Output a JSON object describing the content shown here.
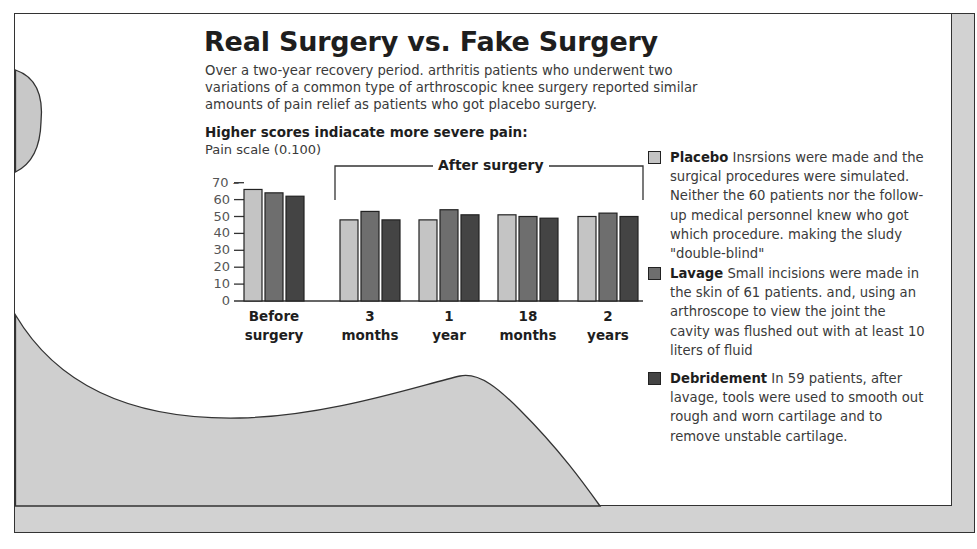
{
  "title": "Real Surgery vs. Fake Surgery",
  "subtitle": "Over a two-year recovery period. arthritis patients who underwent two variations of a common type of arthroscopic knee surgery reported similar amounts of pain relief as patients who got placebo surgery.",
  "axis": {
    "heading": "Higher scores indiacate more severe pain:",
    "scale_label": "Pain scale (0.100)",
    "ticks": [
      "70",
      "60",
      "50",
      "40",
      "30",
      "20",
      "10",
      "0"
    ]
  },
  "bracket_label": "After surgery",
  "groups": [
    {
      "line1": "Before",
      "line2": "surgery"
    },
    {
      "line1": "3",
      "line2": "months"
    },
    {
      "line1": "1",
      "line2": "year"
    },
    {
      "line1": "18",
      "line2": "months"
    },
    {
      "line1": "2",
      "line2": "years"
    }
  ],
  "legend": [
    {
      "name": "Placebo",
      "color": "#c4c4c4",
      "text": "Insrsions were made and the surgical procedures were simulated. Neither the 60 patients nor the follow-up medical personnel knew who got which procedure. making the sludy \"double-blind\""
    },
    {
      "name": "Lavage",
      "color": "#6e6e6e",
      "text": "Small incisions were made in the skin of 61 patients. and, using an arthroscope to view the joint the cavity was flushed out with at least 10 liters of fluid"
    },
    {
      "name": "Debridement",
      "color": "#444444",
      "text": "In 59 patients, after lavage, tools were used to smooth out rough and worn cartilage and to remove unstable cartilage."
    }
  ],
  "chart_data": {
    "type": "bar",
    "title": "Real Surgery vs. Fake Surgery",
    "subtitle": "Over a two-year recovery period. arthritis patients who underwent two variations of a common type of arthroscopic knee surgery reported similar amounts of pain relief as patients who got placebo surgery.",
    "xlabel": "",
    "ylabel": "Pain scale (0.100)",
    "ylim": [
      0,
      70
    ],
    "yticks": [
      0,
      10,
      20,
      30,
      40,
      50,
      60,
      70
    ],
    "grid": false,
    "legend_position": "right",
    "categories": [
      "Before surgery",
      "3 months",
      "1 year",
      "18 months",
      "2 years"
    ],
    "series": [
      {
        "name": "Placebo",
        "color": "#c4c4c4",
        "values": [
          66,
          48,
          48,
          51,
          50
        ]
      },
      {
        "name": "Lavage",
        "color": "#6e6e6e",
        "values": [
          64,
          53,
          54,
          50,
          52
        ]
      },
      {
        "name": "Debridement",
        "color": "#444444",
        "values": [
          62,
          48,
          51,
          49,
          50
        ]
      }
    ],
    "annotations": [
      "Higher scores indiacate more severe pain:",
      "After surgery"
    ]
  }
}
